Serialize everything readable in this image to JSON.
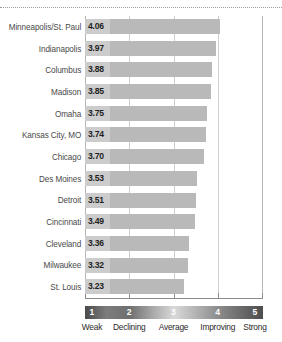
{
  "chart_data": {
    "type": "bar",
    "orientation": "horizontal",
    "title": "",
    "subtitle": "",
    "xlabel": "",
    "ylabel": "",
    "xlim": [
      1,
      5
    ],
    "grid": true,
    "legend_position": "bottom",
    "categories": [
      "Minneapolis/St. Paul",
      "Indianapolis",
      "Columbus",
      "Madison",
      "Omaha",
      "Kansas City, MO",
      "Chicago",
      "Des Moines",
      "Detroit",
      "Cincinnati",
      "Cleveland",
      "Milwaukee",
      "St. Louis"
    ],
    "values": [
      4.06,
      3.97,
      3.88,
      3.85,
      3.75,
      3.74,
      3.7,
      3.53,
      3.51,
      3.49,
      3.36,
      3.32,
      3.23
    ],
    "value_labels": [
      "4.06",
      "3.97",
      "3.88",
      "3.85",
      "3.75",
      "3.74",
      "3.70",
      "3.53",
      "3.51",
      "3.49",
      "3.36",
      "3.32",
      "3.23"
    ],
    "xticks": [
      1,
      2,
      3,
      4,
      5
    ],
    "xtick_labels": [
      "1",
      "2",
      "3",
      "4",
      "5"
    ],
    "scale_labels": [
      "Weak",
      "Declining",
      "Average",
      "Improving",
      "Strong"
    ],
    "bar_color": "#b9b9b9",
    "value_label_bg": "#cccccc",
    "gridline_color": "#cfcfcf",
    "axis_color": "#8d8d8d"
  }
}
